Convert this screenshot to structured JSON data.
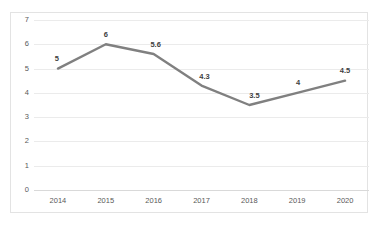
{
  "chart_data": {
    "type": "line",
    "title": "",
    "subtitle": "",
    "xlabel": "",
    "ylabel": "",
    "categories": [
      "2014",
      "2015",
      "2016",
      "2017",
      "2018",
      "2019",
      "2020"
    ],
    "values": [
      5,
      6,
      5.6,
      4.3,
      3.5,
      4,
      4.5
    ],
    "point_labels": [
      "5",
      "6",
      "5.6",
      "4.3",
      "3.5",
      "4",
      "4.5"
    ],
    "series": [
      {
        "name": "",
        "values": [
          5,
          6,
          5.6,
          4.3,
          3.5,
          4,
          4.5
        ]
      }
    ],
    "ylim": [
      0,
      7
    ],
    "ytick_labels": [
      "0",
      "1",
      "2",
      "3",
      "4",
      "5",
      "6",
      "7"
    ],
    "ytick_values": [
      0,
      1,
      2,
      3,
      4,
      5,
      6,
      7
    ],
    "grid": "horizontal",
    "legend": "none",
    "annotations": [],
    "colors": {
      "line": "#808080",
      "gridline": "#ebebeb",
      "axis": "#d9d9d9",
      "tick_text": "#595959",
      "label_text": "#404040",
      "plot_background": "#ffffff",
      "chart_border": "#e3e3e3"
    },
    "line_width": 2.4,
    "markers": "none"
  }
}
